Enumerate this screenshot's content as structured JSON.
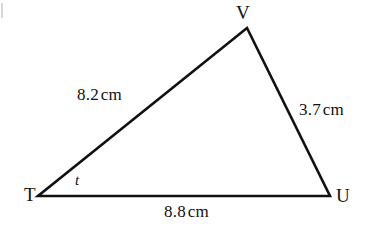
{
  "figure": {
    "type": "geometry-diagram",
    "shape": "triangle",
    "background_color": "#ffffff",
    "stroke_color": "#111111",
    "stroke_width": 2.6
  },
  "vertices": [
    {
      "id": "T",
      "label": "T",
      "x": 38,
      "y": 196
    },
    {
      "id": "U",
      "label": "U",
      "x": 330,
      "y": 196
    },
    {
      "id": "V",
      "label": "V",
      "x": 247,
      "y": 28
    }
  ],
  "sides": [
    {
      "id": "TV",
      "from": "T",
      "to": "V",
      "value": "8.2",
      "unit": "cm"
    },
    {
      "id": "VU",
      "from": "V",
      "to": "U",
      "value": "3.7",
      "unit": "cm"
    },
    {
      "id": "TU",
      "from": "T",
      "to": "U",
      "value": "8.8",
      "unit": "cm"
    }
  ],
  "angles": [
    {
      "id": "T",
      "label": "t",
      "at_vertex": "T"
    }
  ],
  "chart_data": {
    "type": "diagram",
    "title": "",
    "categories": [
      "TV",
      "VU",
      "TU"
    ],
    "values": [
      8.2,
      3.7,
      8.8
    ],
    "units": "cm",
    "annotations": [
      "t"
    ]
  }
}
